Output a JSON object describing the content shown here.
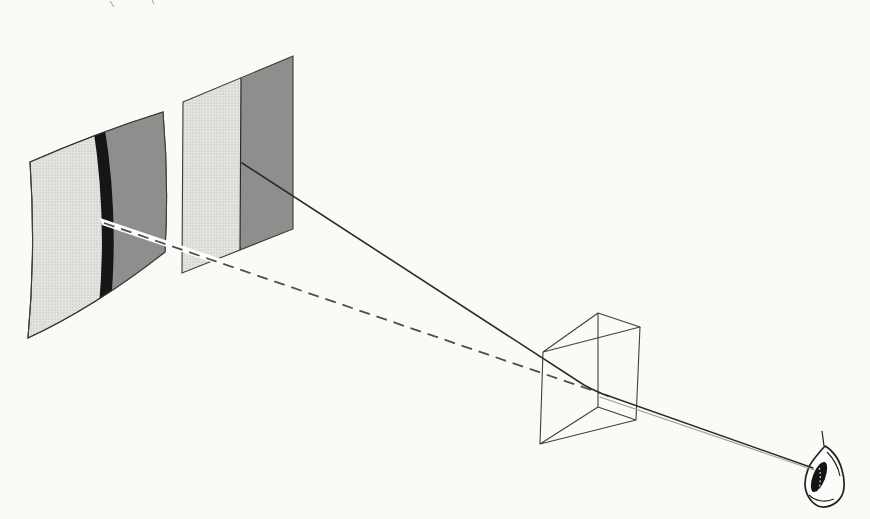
{
  "figure": {
    "type": "optics-illustration",
    "width": 870,
    "height": 519
  },
  "colors": {
    "paper": "#fbfaf6",
    "halftone_base": "#e4e4e0",
    "halftone_dot": "#a9a9a5",
    "dark_gray": "#8e8e8c",
    "stripe_black": "#161616",
    "outline": "#3a3a3a",
    "prism_line": "#3f3f3f",
    "ray": "#2b2b2b",
    "dash": "#4f4f4f",
    "beam_secondary": "#9c9c9c",
    "ribbon_white": "#ffffff",
    "eye_stroke": "#1f1f1f",
    "eye_fill": "#fcfcfa",
    "iris_black": "#141414",
    "iris_highlight": "#e6e6e6",
    "speck": "#9a9a9a"
  },
  "shapes": {
    "curved_screen": {
      "outline": "M 30,162 Q 96,133 163,112 Q 169,182 165,252 Q 95,307 28,338 Q 36,251 30,162 Z",
      "dark_region": "M 103,122 Q 118,214 111,304 L 176,266 Q 178,180 168,100 Z",
      "absorption_stripe": "M 93,126 Q 107,216 99,306 L 111,304 Q 119,214 104,123 Z"
    },
    "flat_screen": {
      "light_region": "M 183,102 L 241,78 L 240,250 L 182,273 Z",
      "dark_region": "M 241,78 L 293,56 L 293,229 L 240,250 Z",
      "outline": "M 183,102 L 293,56 L 293,229 L 182,273 Z",
      "divider": "M 241,78 L 240,250"
    },
    "rays": {
      "sight_ribbon": "M 100,218 L 239,265 L 241,272 L 102,225 Z",
      "apparent_ray_dashed": "M 104,223 L 600,393",
      "dash_pattern": "11 7",
      "incident_ray": "M 242,163 L 584,385 Q 597,392 608,396",
      "beam_upper": "M 606,395 L 813,468",
      "beam_lower": "M 600,397 L 814,470"
    },
    "prism": {
      "top_face": "M 543,352 L 598,313 L 640,327 Z",
      "bottom_face": "M 540,444 L 598,407 L 636,420 Z",
      "edge_left": "M 543,352 L 540,444",
      "edge_front": "M 598,313 L 598,407",
      "edge_right": "M 640,327 L 636,420"
    },
    "eye": {
      "outline": "M 825,446 C 831,449 839,458 842,470 C 845,480 845,491 841,497 C 836,505 826,509 818,506 C 810,502 805,493 805,484 C 805,475 809,465 814,459 C 818,454 822,449 825,446 Z",
      "lash": "M 824,446 L 822,431",
      "upper_lid_inner": "M 827,452 C 833,458 838,466 840,476",
      "lower_lid_inner": "M 809,495 C 815,501 825,503 834,499",
      "iris": {
        "cx": 819,
        "cy": 477,
        "rx": 6.2,
        "ry": 16,
        "transform": "rotate(21 819 477)"
      },
      "iris_highlight": "M 818,464 C 821,471 821,482 818.5,491",
      "iris_dash_pattern": "1.6 2.6"
    },
    "specks": "M 110,1 L 114,7 M 152,0 L 154,4"
  }
}
